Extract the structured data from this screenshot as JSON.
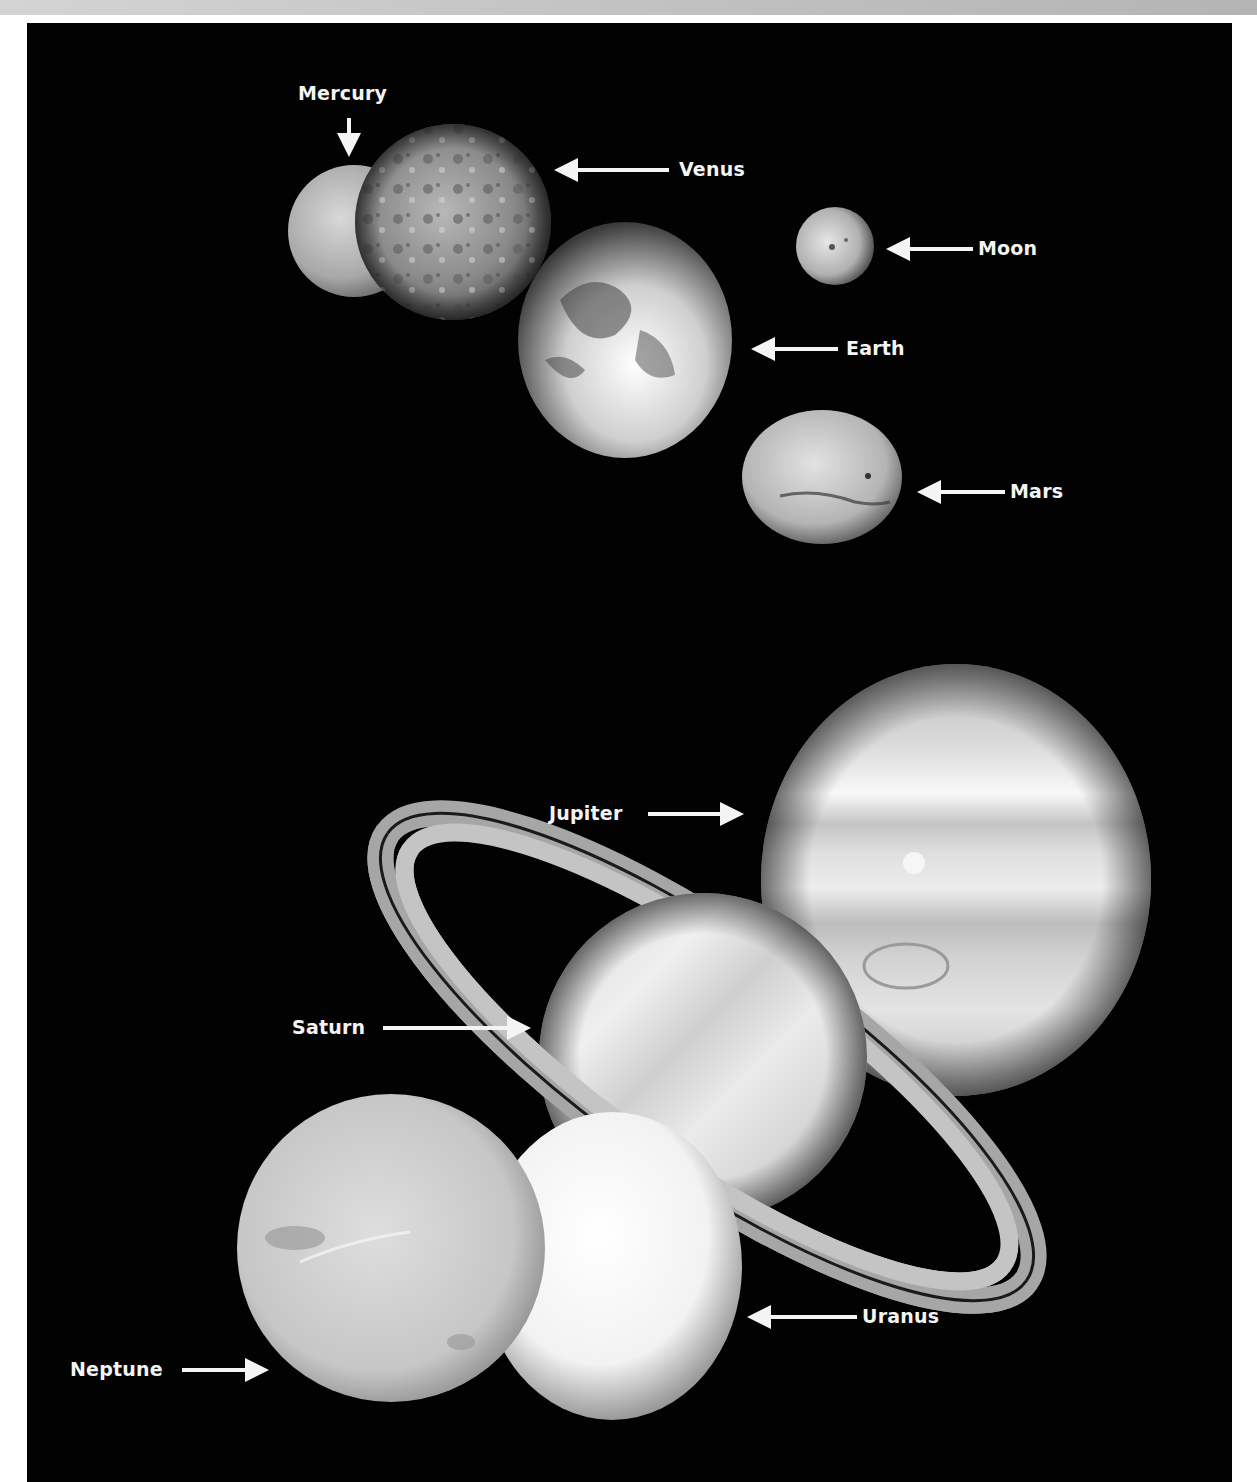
{
  "figure": {
    "background": "#020202",
    "frame_band_color": "#c4c4c4",
    "label_color": "#f4f4f4"
  },
  "labels": {
    "mercury": "Mercury",
    "venus": "Venus",
    "moon": "Moon",
    "earth": "Earth",
    "mars": "Mars",
    "jupiter": "Jupiter",
    "saturn": "Saturn",
    "uranus": "Uranus",
    "neptune": "Neptune"
  },
  "bodies": [
    {
      "name": "Mercury",
      "arrow": "down-arrow"
    },
    {
      "name": "Venus",
      "arrow": "left-arrow"
    },
    {
      "name": "Moon",
      "arrow": "left-arrow"
    },
    {
      "name": "Earth",
      "arrow": "left-arrow"
    },
    {
      "name": "Mars",
      "arrow": "left-arrow"
    },
    {
      "name": "Jupiter",
      "arrow": "right-arrow"
    },
    {
      "name": "Saturn",
      "arrow": "right-arrow"
    },
    {
      "name": "Uranus",
      "arrow": "left-arrow"
    },
    {
      "name": "Neptune",
      "arrow": "right-arrow"
    }
  ]
}
